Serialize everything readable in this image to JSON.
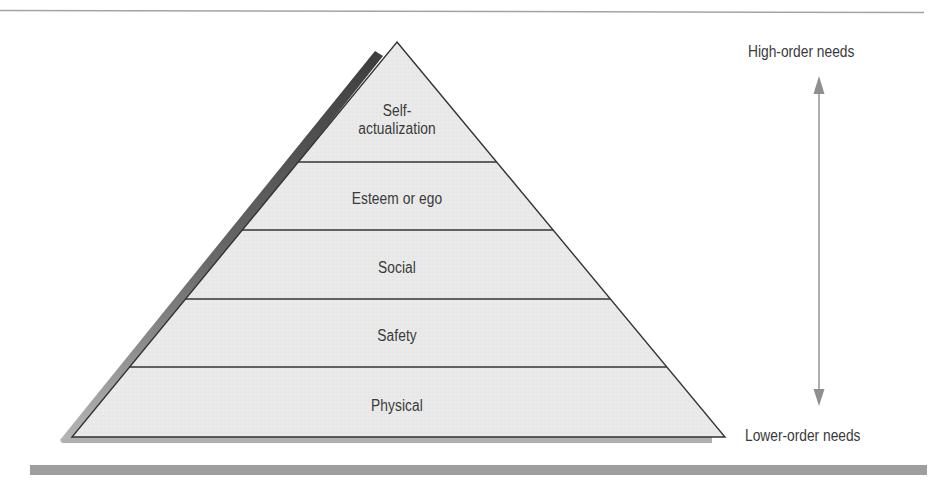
{
  "diagram": {
    "type": "pyramid",
    "title": "",
    "layers": [
      {
        "index": 0,
        "line1": "Self-",
        "line2": "actualization"
      },
      {
        "index": 1,
        "label": "Esteem or ego"
      },
      {
        "index": 2,
        "label": "Social"
      },
      {
        "index": 3,
        "label": "Safety"
      },
      {
        "index": 4,
        "label": "Physical"
      }
    ],
    "axis": {
      "top_label": "High-order needs",
      "bottom_label": "Lower-order needs",
      "arrow": "bidirectional-vertical"
    },
    "colors": {
      "pyramid_fill": "#e8e8e8",
      "outline": "#333333",
      "shadow_dark": "#555555",
      "shadow_light": "#a8a8a8",
      "arrow": "#9a9a9a",
      "rule_bottom": "#9e9e9e",
      "rule_top": "#a0a0a0",
      "text": "#3a3a3a"
    }
  }
}
